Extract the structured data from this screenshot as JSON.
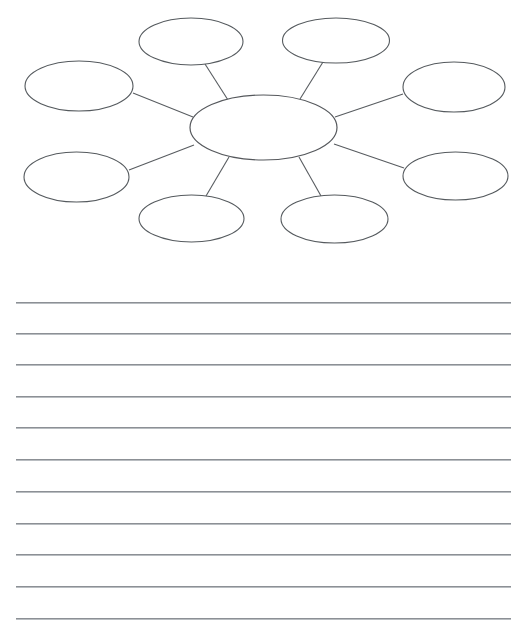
{
  "worksheet": {
    "type": "graphic-organizer-worksheet",
    "title": "",
    "background_color": "#ffffff"
  },
  "diagram": {
    "kind": "concept-web",
    "name": "spider-web-organizer",
    "label": "",
    "stroke_color": "#555a5e",
    "fill_color": "#ffffff",
    "center": {
      "name": "center-oval",
      "label": "",
      "cx": 263.5,
      "cy": 127.5,
      "rx": 73.5,
      "ry": 32.5
    },
    "satellites": [
      {
        "name": "oval-top-left",
        "label": "",
        "cx": 191.0,
        "cy": 41.5,
        "rx": 52.0,
        "ry": 23.5
      },
      {
        "name": "oval-top-right",
        "label": "",
        "cx": 336.0,
        "cy": 40.5,
        "rx": 53.5,
        "ry": 22.5
      },
      {
        "name": "oval-left-upper",
        "label": "",
        "cx": 79.0,
        "cy": 86.0,
        "rx": 54.0,
        "ry": 25.0
      },
      {
        "name": "oval-right-upper",
        "label": "",
        "cx": 454.0,
        "cy": 87.0,
        "rx": 51.0,
        "ry": 25.0
      },
      {
        "name": "oval-left-lower",
        "label": "",
        "cx": 76.5,
        "cy": 177.0,
        "rx": 52.5,
        "ry": 25.0
      },
      {
        "name": "oval-right-lower",
        "label": "",
        "cx": 455.5,
        "cy": 176.0,
        "rx": 52.5,
        "ry": 24.0
      },
      {
        "name": "oval-bottom-left",
        "label": "",
        "cx": 191.5,
        "cy": 218.5,
        "rx": 52.5,
        "ry": 23.5
      },
      {
        "name": "oval-bottom-right",
        "label": "",
        "cx": 334.5,
        "cy": 219.0,
        "rx": 53.5,
        "ry": 24.0
      }
    ],
    "spokes": [
      {
        "name": "spoke-to-top-left",
        "x1": 205.0,
        "y1": 64.0,
        "x2": 228.0,
        "y2": 100.0
      },
      {
        "name": "spoke-to-top-right",
        "x1": 323.0,
        "y1": 62.0,
        "x2": 300.0,
        "y2": 99.0
      },
      {
        "name": "spoke-to-left-upper",
        "x1": 133.0,
        "y1": 93.0,
        "x2": 193.0,
        "y2": 117.0
      },
      {
        "name": "spoke-to-right-upper",
        "x1": 403.0,
        "y1": 94.0,
        "x2": 335.0,
        "y2": 117.0
      },
      {
        "name": "spoke-to-left-lower",
        "x1": 129.0,
        "y1": 170.0,
        "x2": 194.0,
        "y2": 145.0
      },
      {
        "name": "spoke-to-right-lower",
        "x1": 404.0,
        "y1": 168.0,
        "x2": 334.0,
        "y2": 144.0
      },
      {
        "name": "spoke-to-bottom-left",
        "x1": 206.0,
        "y1": 196.0,
        "x2": 229.0,
        "y2": 157.0
      },
      {
        "name": "spoke-to-bottom-right",
        "x1": 321.0,
        "y1": 196.0,
        "x2": 299.0,
        "y2": 157.0
      }
    ]
  },
  "writing_area": {
    "name": "lined-writing-area",
    "line_color": "#8c9095",
    "line_left": 16,
    "line_width": 495,
    "line_count": 11,
    "lines": [
      {
        "name": "rule-line-1",
        "index": 1,
        "y": 22,
        "text": ""
      },
      {
        "name": "rule-line-2",
        "index": 2,
        "y": 53,
        "text": ""
      },
      {
        "name": "rule-line-3",
        "index": 3,
        "y": 84,
        "text": ""
      },
      {
        "name": "rule-line-4",
        "index": 4,
        "y": 116,
        "text": ""
      },
      {
        "name": "rule-line-5",
        "index": 5,
        "y": 147,
        "text": ""
      },
      {
        "name": "rule-line-6",
        "index": 6,
        "y": 179,
        "text": ""
      },
      {
        "name": "rule-line-7",
        "index": 7,
        "y": 211,
        "text": ""
      },
      {
        "name": "rule-line-8",
        "index": 8,
        "y": 243,
        "text": ""
      },
      {
        "name": "rule-line-9",
        "index": 9,
        "y": 274,
        "text": ""
      },
      {
        "name": "rule-line-10",
        "index": 10,
        "y": 306,
        "text": ""
      },
      {
        "name": "rule-line-11",
        "index": 11,
        "y": 338,
        "text": ""
      }
    ]
  }
}
